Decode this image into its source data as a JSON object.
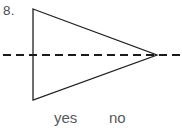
{
  "page": {
    "width": 182,
    "height": 132,
    "background_color": "#ffffff"
  },
  "question": {
    "number_label": "8.",
    "number_color": "#4d4d4d"
  },
  "figure": {
    "name": "triangle-with-dashed-line-of-symmetry",
    "stroke_color": "#231f20",
    "triangle": {
      "shape": "isosceles-triangle-pointing-right",
      "stroke_width": 1.3,
      "points": "33,9 157,55 33,100",
      "vertices": [
        {
          "label": "top-left",
          "x": 33,
          "y": 9
        },
        {
          "label": "right-apex",
          "x": 157,
          "y": 55
        },
        {
          "label": "bottom-left",
          "x": 33,
          "y": 100
        }
      ]
    },
    "dashed_line": {
      "orientation": "horizontal",
      "x1": 3,
      "y1": 55,
      "x2": 181,
      "y2": 55,
      "stroke_width": 2.6,
      "dash_on": 8,
      "dash_off": 5,
      "color": "#1a1a1a"
    }
  },
  "answers": {
    "options": [
      {
        "label": "yes",
        "value": "yes"
      },
      {
        "label": "no",
        "value": "no"
      }
    ],
    "text_color": "#58595b"
  }
}
